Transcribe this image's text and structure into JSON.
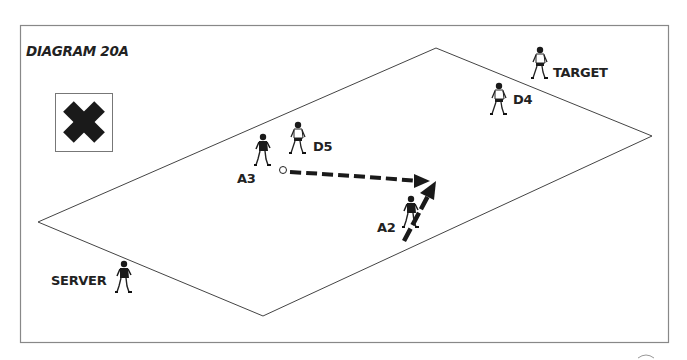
{
  "diagram": {
    "title": "DIAGRAM 20A",
    "legend_icon": "x-cross-icon",
    "field_shape": "parallelogram",
    "players": [
      {
        "id": "target",
        "label": "TARGET",
        "role": "target",
        "shirt": "light"
      },
      {
        "id": "d4",
        "label": "D4",
        "role": "defender",
        "shirt": "light"
      },
      {
        "id": "d5",
        "label": "D5",
        "role": "defender",
        "shirt": "light"
      },
      {
        "id": "a3",
        "label": "A3",
        "role": "attacker",
        "shirt": "dark"
      },
      {
        "id": "a2",
        "label": "A2",
        "role": "attacker",
        "shirt": "dark"
      },
      {
        "id": "server",
        "label": "SERVER",
        "role": "server",
        "shirt": "dark"
      }
    ],
    "movements": [
      {
        "type": "pass",
        "style": "dashed-arrow",
        "from": "A3 (ball)",
        "to": "ahead of A2"
      },
      {
        "type": "run",
        "style": "solid-arrow",
        "player": "A2",
        "direction": "forward"
      }
    ],
    "colors": {
      "ink": "#222222",
      "frame": "#888888",
      "background": "#ffffff"
    }
  }
}
